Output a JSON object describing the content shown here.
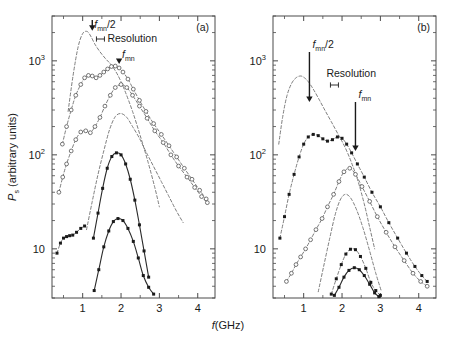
{
  "figure": {
    "title": "",
    "xlabel": "f(GHz)",
    "ylabel_main": "P",
    "ylabel_sub": "s",
    "ylabel_rest": " (arbitrary units)",
    "panel_a_label": "(a)",
    "panel_b_label": "(b)"
  },
  "annotations": {
    "fmn_half_base": "f",
    "fmn_half_sub": "mn",
    "fmn_half_tail": "/2",
    "fmn_base": "f",
    "fmn_sub": "mn",
    "resolution": "Resolution"
  },
  "axes": {
    "x_ticks": [
      "1",
      "2",
      "3",
      "4"
    ],
    "x_min": 0.2,
    "x_max": 4.45,
    "y_ticks": [
      {
        "label_base": "10",
        "label_exp": "3",
        "value": 1000
      },
      {
        "label_base": "10",
        "label_exp": "2",
        "value": 100
      },
      {
        "label_base": "10",
        "label_exp": "",
        "value": 10
      }
    ],
    "y_min": 3.0,
    "y_max": 3000,
    "y_scale": "log",
    "grid": false
  },
  "chart_data": {
    "type": "line",
    "xlabel": "f(GHz)",
    "ylabel": "P_s (arbitrary units)",
    "xlim": [
      0.2,
      4.45
    ],
    "ylim": [
      3.0,
      3000
    ],
    "yscale": "log",
    "grid": false,
    "legend": "none",
    "panels": [
      {
        "panel": "(a)",
        "annotations": [
          {
            "text": "f_mn/2",
            "x": 1.25,
            "arrow_to_y": 1900
          },
          {
            "text": "Resolution",
            "x": 1.75,
            "marker": "resolution-bar"
          },
          {
            "text": "f_mn",
            "x": 1.95,
            "arrow_to_y": 800
          }
        ],
        "series": [
          {
            "name": "curve-a1-dashed-no-markers",
            "style": "dashed",
            "marker": "none",
            "x": [
              0.62,
              0.75,
              0.88,
              1.0,
              1.12,
              1.22,
              1.32,
              1.45,
              1.6,
              1.75,
              1.92,
              2.1,
              2.3,
              2.5,
              2.7,
              2.88,
              3.0
            ],
            "y": [
              290,
              700,
              1400,
              1950,
              2050,
              1800,
              1500,
              1250,
              1050,
              900,
              700,
              480,
              290,
              160,
              85,
              45,
              28
            ]
          },
          {
            "name": "curve-a2-open-circles",
            "style": "dashed",
            "marker": "open-circle",
            "x": [
              0.47,
              0.58,
              0.7,
              0.82,
              0.95,
              1.05,
              1.15,
              1.25,
              1.35,
              1.45,
              1.55,
              1.65,
              1.75,
              1.85,
              1.95,
              2.05,
              2.18,
              2.32,
              2.48,
              2.65,
              2.85,
              3.05,
              3.25,
              3.45,
              3.65,
              3.85,
              4.05,
              4.22
            ],
            "y": [
              130,
              200,
              300,
              430,
              560,
              660,
              700,
              690,
              660,
              700,
              760,
              820,
              870,
              880,
              840,
              760,
              640,
              500,
              380,
              290,
              215,
              165,
              125,
              95,
              72,
              55,
              42,
              34
            ]
          },
          {
            "name": "curve-a3-open-circles-lower",
            "style": "dashed",
            "marker": "open-circle",
            "x": [
              0.38,
              0.48,
              0.58,
              0.7,
              0.82,
              0.95,
              1.08,
              1.2,
              1.32,
              1.45,
              1.58,
              1.72,
              1.85,
              2.0,
              2.15,
              2.3,
              2.48,
              2.68,
              2.88,
              3.1,
              3.3,
              3.5,
              3.72,
              3.92,
              4.1,
              4.25
            ],
            "y": [
              40,
              58,
              80,
              110,
              145,
              175,
              180,
              172,
              200,
              250,
              330,
              430,
              520,
              560,
              520,
              430,
              330,
              245,
              180,
              135,
              100,
              76,
              58,
              45,
              36,
              31
            ]
          },
          {
            "name": "curve-a4-dashed-peak",
            "style": "dashed",
            "marker": "none",
            "x": [
              1.1,
              1.25,
              1.4,
              1.55,
              1.7,
              1.85,
              2.0,
              2.15,
              2.3,
              2.48,
              2.65,
              2.85,
              3.05,
              3.25,
              3.45,
              3.62
            ],
            "y": [
              16,
              32,
              62,
              110,
              185,
              255,
              275,
              250,
              200,
              150,
              108,
              75,
              52,
              36,
              25,
              19
            ]
          },
          {
            "name": "curve-a5-solid-dots-mid",
            "style": "solid",
            "marker": "closed-square",
            "x": [
              1.28,
              1.4,
              1.52,
              1.64,
              1.76,
              1.88,
              2.0,
              2.12,
              2.24,
              2.36,
              2.48,
              2.6,
              2.72
            ],
            "y": [
              13,
              24,
              44,
              72,
              96,
              105,
              100,
              80,
              55,
              33,
              18,
              9.5,
              5.0
            ]
          },
          {
            "name": "curve-a6-solid-dots-low",
            "style": "solid",
            "marker": "closed-square",
            "x": [
              1.3,
              1.42,
              1.55,
              1.68,
              1.8,
              1.92,
              2.05,
              2.18,
              2.32,
              2.45,
              2.58,
              2.72,
              2.85
            ],
            "y": [
              3.6,
              6.0,
              10.5,
              15.5,
              19.5,
              21.0,
              20.0,
              16.5,
              12.0,
              8.0,
              5.2,
              3.9,
              3.3
            ]
          },
          {
            "name": "curve-a7-low-flat-dots",
            "style": "dashed",
            "marker": "closed-square",
            "x": [
              0.33,
              0.42,
              0.5,
              0.58,
              0.66,
              0.74,
              0.84,
              0.95,
              1.05
            ],
            "y": [
              9.0,
              11.5,
              13.0,
              13.5,
              13.8,
              14.0,
              15.0,
              16.5,
              17.5
            ]
          }
        ]
      },
      {
        "panel": "(b)",
        "annotations": [
          {
            "text": "f_mn/2",
            "x": 1.15,
            "arrow_to_y": 330
          },
          {
            "text": "Resolution",
            "x": 1.75,
            "marker": "resolution-bar"
          },
          {
            "text": "f_mn",
            "x": 2.35,
            "arrow_to_y": 95
          }
        ],
        "series": [
          {
            "name": "curve-b1-dashed-top",
            "style": "dashed",
            "marker": "none",
            "x": [
              0.35,
              0.45,
              0.56,
              0.68,
              0.8,
              0.92,
              1.02,
              1.12,
              1.25,
              1.4,
              1.55,
              1.72,
              1.9,
              2.08,
              2.25,
              2.42,
              2.58,
              2.72,
              2.85
            ],
            "y": [
              130,
              250,
              420,
              570,
              660,
              690,
              660,
              600,
              500,
              390,
              300,
              225,
              165,
              120,
              82,
              52,
              30,
              17,
              10
            ]
          },
          {
            "name": "curve-b2-closed-dots-upper",
            "style": "dashed",
            "marker": "closed-square",
            "x": [
              0.38,
              0.5,
              0.62,
              0.75,
              0.88,
              1.0,
              1.12,
              1.25,
              1.38,
              1.5,
              1.62,
              1.75,
              1.88,
              2.0,
              2.12,
              2.25,
              2.4,
              2.58,
              2.78,
              3.0,
              3.22,
              3.45,
              3.68,
              3.9,
              4.08,
              4.22
            ],
            "y": [
              13,
              22,
              38,
              62,
              95,
              130,
              155,
              165,
              160,
              148,
              140,
              145,
              155,
              150,
              130,
              105,
              80,
              58,
              40,
              28,
              19,
              13,
              9.0,
              6.5,
              5.2,
              4.5
            ]
          },
          {
            "name": "curve-b3-open-circles",
            "style": "dashed",
            "marker": "open-circle",
            "x": [
              0.55,
              0.68,
              0.8,
              0.92,
              1.05,
              1.18,
              1.32,
              1.48,
              1.62,
              1.78,
              1.92,
              2.05,
              2.2,
              2.35,
              2.52,
              2.72,
              2.92,
              3.15,
              3.38,
              3.62,
              3.85,
              4.05,
              4.22
            ],
            "y": [
              4.5,
              5.5,
              6.8,
              8.2,
              10.0,
              12.5,
              16.0,
              21.0,
              28.0,
              38.0,
              52.0,
              66.0,
              72.0,
              62.0,
              46.0,
              32.0,
              22.0,
              15.0,
              10.5,
              7.5,
              5.5,
              4.5,
              4.0
            ]
          },
          {
            "name": "curve-b4-dashed-mid",
            "style": "dashed",
            "marker": "none",
            "x": [
              1.38,
              1.52,
              1.68,
              1.82,
              1.95,
              2.08,
              2.22,
              2.38,
              2.55,
              2.72,
              2.88,
              3.02
            ],
            "y": [
              3.5,
              6.5,
              13.0,
              23.0,
              33.0,
              38.0,
              35.0,
              26.0,
              16.5,
              9.5,
              5.5,
              3.6
            ]
          },
          {
            "name": "curve-b5-dashed-dots-mid",
            "style": "dashed",
            "marker": "closed-square",
            "x": [
              1.72,
              1.85,
              1.98,
              2.1,
              2.22,
              2.35,
              2.48,
              2.62,
              2.75,
              2.88,
              3.0
            ],
            "y": [
              3.3,
              4.8,
              6.8,
              8.8,
              9.9,
              9.8,
              8.3,
              6.2,
              4.4,
              3.6,
              3.2
            ]
          },
          {
            "name": "curve-b6-solid-dots-low",
            "style": "solid",
            "marker": "closed-square",
            "x": [
              1.8,
              1.92,
              2.05,
              2.18,
              2.32,
              2.45,
              2.58,
              2.72,
              2.85,
              2.96
            ],
            "y": [
              3.2,
              3.9,
              5.0,
              5.9,
              6.3,
              6.0,
              5.2,
              4.2,
              3.4,
              3.1
            ]
          }
        ]
      }
    ]
  }
}
